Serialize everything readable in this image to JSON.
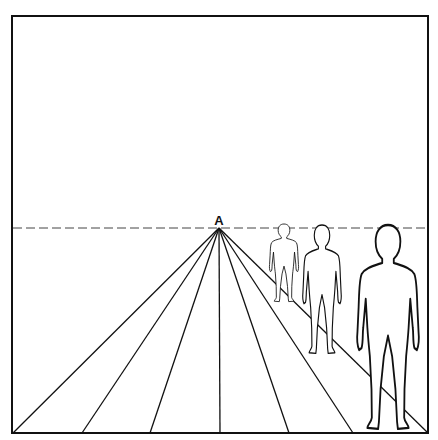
{
  "diagram": {
    "vanishing_point": {
      "label": "A",
      "x": 219,
      "y": 228
    },
    "horizon_y": 228,
    "frame": {
      "x": 12,
      "y": 16,
      "width": 416,
      "height": 417
    },
    "ground_lines_bottom_x": [
      13,
      82,
      150,
      220,
      289,
      353,
      428
    ],
    "figures": [
      {
        "name": "far",
        "cx": 284,
        "top": 224,
        "feet": 302
      },
      {
        "name": "middle",
        "cx": 322,
        "top": 225,
        "feet": 354
      },
      {
        "name": "near",
        "cx": 388,
        "top": 225,
        "feet": 430
      }
    ],
    "colors": {
      "stroke": "#111111",
      "background": "#ffffff"
    }
  }
}
